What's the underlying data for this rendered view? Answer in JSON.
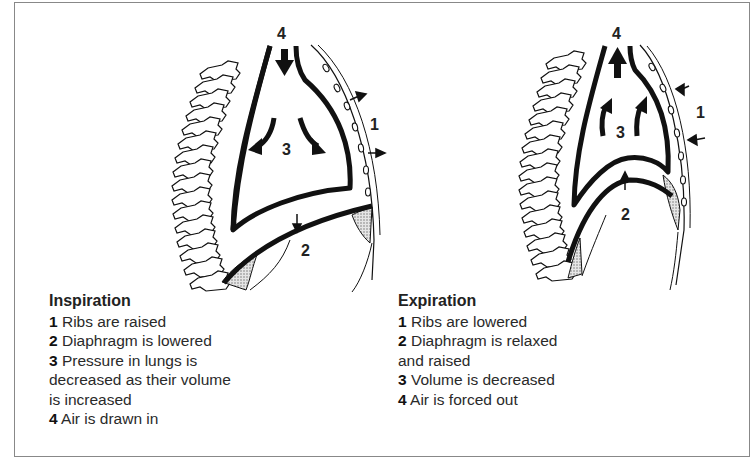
{
  "diagram": {
    "panels": [
      {
        "id": "inspiration",
        "title": "Inspiration",
        "markers": {
          "ribs": "1",
          "diaphragm": "2",
          "lungs": "3",
          "airway": "4"
        },
        "steps": [
          {
            "num": "1",
            "text": "Ribs are raised"
          },
          {
            "num": "2",
            "text": "Diaphragm is lowered"
          },
          {
            "num": "3",
            "text": "Pressure in lungs is",
            "cont": [
              "decreased as their volume",
              "is increased"
            ]
          },
          {
            "num": "4",
            "text": "Air is drawn in"
          }
        ]
      },
      {
        "id": "expiration",
        "title": "Expiration",
        "markers": {
          "ribs": "1",
          "diaphragm": "2",
          "lungs": "3",
          "airway": "4"
        },
        "steps": [
          {
            "num": "1",
            "text": "Ribs are lowered"
          },
          {
            "num": "2",
            "text": "Diaphragm is relaxed",
            "cont": [
              "and raised"
            ]
          },
          {
            "num": "3",
            "text": "Volume is decreased"
          },
          {
            "num": "4",
            "text": "Air is forced out"
          }
        ]
      }
    ],
    "colors": {
      "ink": "#111111",
      "frame": "#888888",
      "shade": "#bdbdbd"
    }
  }
}
